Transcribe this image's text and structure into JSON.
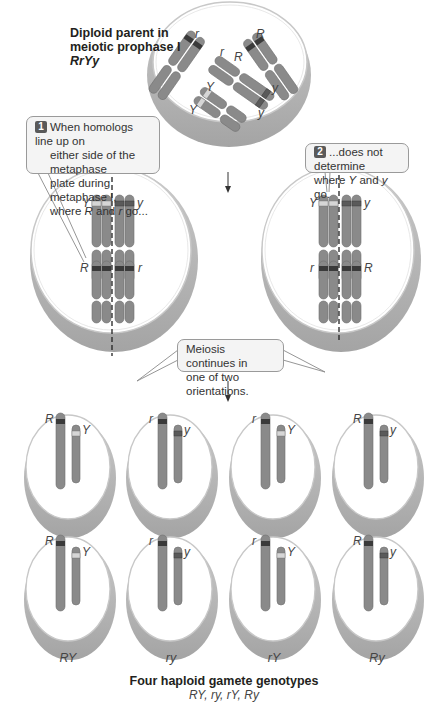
{
  "parent": {
    "title_line1": "Diploid parent in",
    "title_line2": "meiotic prophase I",
    "genotype": "RrYy",
    "allele_labels": [
      "r",
      "r",
      "R",
      "R",
      "Y",
      "Y",
      "y",
      "y"
    ]
  },
  "callouts": {
    "step1": {
      "number": "1",
      "text_line1": "When homologs line up on",
      "text_line2": "either side of the metaphase",
      "text_line3": "plate during metaphase I,",
      "text_line4_pre": "where ",
      "text_line4_a": "R",
      "text_line4_mid": " and ",
      "text_line4_b": "r",
      "text_line4_post": " go..."
    },
    "step2": {
      "number": "2",
      "text_line1": "...does not determine",
      "text_line2_pre": "where ",
      "text_line2_a": "Y",
      "text_line2_mid": " and ",
      "text_line2_b": "y",
      "text_line2_post": " go."
    },
    "continues": {
      "text_line1": "Meiosis continues in",
      "text_line2": "one of two orientations."
    }
  },
  "metaphase_left": {
    "labels": {
      "top_left": "Y",
      "top_right": "y",
      "bottom_left": "R",
      "bottom_right": "r"
    }
  },
  "metaphase_right": {
    "labels": {
      "top_left": "Y",
      "top_right": "y",
      "bottom_left": "r",
      "bottom_right": "R"
    }
  },
  "gametes": {
    "row1": [
      {
        "big": "R",
        "small": "Y"
      },
      {
        "big": "r",
        "small": "y"
      },
      {
        "big": "r",
        "small": "Y"
      },
      {
        "big": "R",
        "small": "y"
      }
    ],
    "row2": [
      {
        "big": "R",
        "small": "Y"
      },
      {
        "big": "r",
        "small": "y"
      },
      {
        "big": "r",
        "small": "Y"
      },
      {
        "big": "R",
        "small": "y"
      }
    ],
    "column_labels": [
      "RY",
      "ry",
      "rY",
      "Ry"
    ]
  },
  "footer": {
    "title": "Four haploid gamete genotypes",
    "subtitle": "RY, ry, rY, Ry"
  },
  "colors": {
    "chromosome": "#8a8a8a",
    "chromosome_dark": "#6e6e6e",
    "band_R": "#3a3a3a",
    "band_Y": "#d6d6d6",
    "band_y": "#5a5a5a",
    "cell_fill": "#ffffff",
    "cell_shadow": "#b3b3b3",
    "cell_rim": "#d0d0d0"
  }
}
